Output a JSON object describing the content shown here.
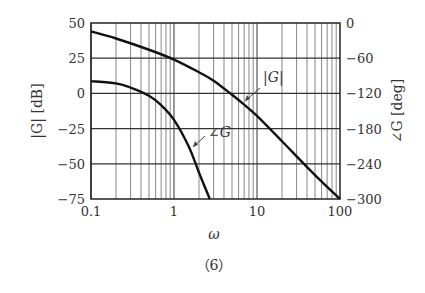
{
  "chart_data": {
    "type": "line",
    "title": "",
    "caption": "（6）",
    "xlabel": "ω",
    "ylabel_left": "|G| [dB]",
    "ylabel_right": "∠G [deg]",
    "xscale": "log",
    "xlim": [
      0.1,
      100
    ],
    "ylim_left": [
      -75,
      50
    ],
    "ylim_right": [
      -300,
      0
    ],
    "x_ticks": [
      "0.1",
      "1",
      "10",
      "100"
    ],
    "y_ticks_left": [
      "50",
      "25",
      "0",
      "−25",
      "−50",
      "−75"
    ],
    "y_ticks_right": [
      "0",
      "−60",
      "−120",
      "−180",
      "−240",
      "−300"
    ],
    "grid": true,
    "series": [
      {
        "name": "|G|",
        "axis": "left",
        "x": [
          0.1,
          0.2,
          0.5,
          1,
          2,
          3,
          5,
          7,
          10,
          20,
          50,
          100
        ],
        "values": [
          44,
          39,
          31,
          24,
          15,
          9,
          -1,
          -8,
          -16,
          -34,
          -58,
          -75
        ]
      },
      {
        "name": "∠G",
        "axis": "right",
        "x": [
          0.1,
          0.2,
          0.3,
          0.5,
          0.7,
          1,
          1.5,
          2,
          2.7
        ],
        "values": [
          -99,
          -103,
          -110,
          -124,
          -140,
          -165,
          -210,
          -255,
          -300
        ]
      }
    ],
    "annotations": [
      {
        "text": "|G|",
        "points_to": "|G|"
      },
      {
        "text": "∠G",
        "points_to": "∠G"
      }
    ]
  }
}
